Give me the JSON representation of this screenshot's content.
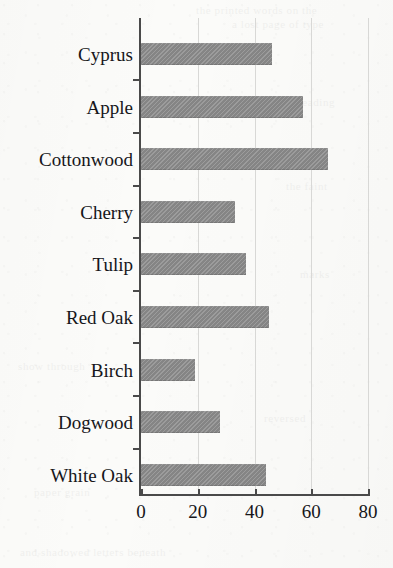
{
  "chart_data": {
    "type": "bar",
    "orientation": "horizontal",
    "title": "",
    "subtitle": "",
    "xlabel": "",
    "ylabel": "",
    "categories": [
      "Cyprus",
      "Apple",
      "Cottonwood",
      "Cherry",
      "Tulip",
      "Red Oak",
      "Birch",
      "Dogwood",
      "White Oak"
    ],
    "values": [
      46,
      57,
      66,
      33,
      37,
      45,
      19,
      28,
      44
    ],
    "xlim": [
      0,
      80
    ],
    "xticks": [
      0,
      20,
      40,
      60,
      80
    ],
    "xtick_labels": [
      "0",
      "20",
      "40",
      "60",
      "80"
    ],
    "grid": "vertical",
    "legend": "none",
    "bar_color": "#8c8c8c",
    "axis_color": "#4a4a4a",
    "gridline_color": "#d8d8d6",
    "background_color": "#fbfbf9"
  },
  "bleed_through_text": [
    {
      "text": "the printed words on the",
      "x": 196,
      "y": 4
    },
    {
      "text": "a lost page of type",
      "x": 232,
      "y": 18
    },
    {
      "text": "reading",
      "x": 298,
      "y": 96
    },
    {
      "text": "the faint",
      "x": 286,
      "y": 180
    },
    {
      "text": "marks",
      "x": 300,
      "y": 268
    },
    {
      "text": "show through",
      "x": 18,
      "y": 360
    },
    {
      "text": "reversed",
      "x": 264,
      "y": 412
    },
    {
      "text": "paper grain",
      "x": 34,
      "y": 486
    },
    {
      "text": "and shadowed letters beneath",
      "x": 20,
      "y": 546
    }
  ]
}
